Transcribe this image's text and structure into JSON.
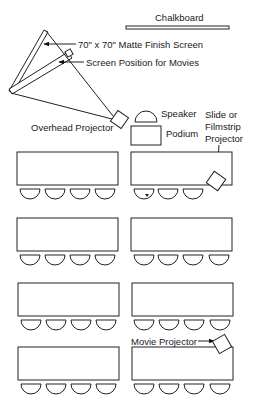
{
  "diagram": {
    "labels": {
      "chalkboard": "Chalkboard",
      "matte_screen": "70\" x 70\" Matte Finish Screen",
      "movie_screen": "Screen Position for Movies",
      "overhead_projector": "Overhead Projector",
      "speaker": "Speaker",
      "podium": "Podium",
      "slide_projector_line1": "Slide or",
      "slide_projector_line2": "Filmstrip",
      "slide_projector_line3": "Projector",
      "movie_projector": "Movie Projector"
    },
    "tables": [
      {
        "row": 1,
        "col": "left",
        "chairs": 4
      },
      {
        "row": 1,
        "col": "right",
        "chairs": 3
      },
      {
        "row": 2,
        "col": "left",
        "chairs": 4
      },
      {
        "row": 2,
        "col": "right",
        "chairs": 4
      },
      {
        "row": 3,
        "col": "left",
        "chairs": 4
      },
      {
        "row": 3,
        "col": "right",
        "chairs": 4
      },
      {
        "row": 4,
        "col": "left",
        "chairs": 4
      },
      {
        "row": 4,
        "col": "right",
        "chairs": 4
      }
    ]
  }
}
